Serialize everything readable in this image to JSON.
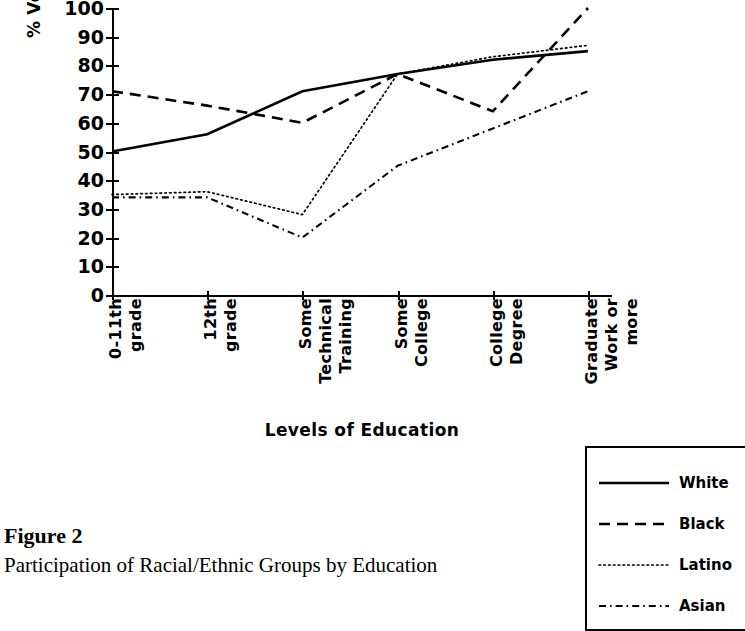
{
  "figure": {
    "number_label": "Figure 2",
    "caption": "Participation of Racial/Ethnic Groups by Education"
  },
  "chart_data": {
    "type": "line",
    "title": "",
    "xlabel": "Levels of Education",
    "ylabel": "% Voting of Eligible Voters",
    "categories": [
      "0-11th grade",
      "12th grade",
      "Some Technical Training",
      "Some College",
      "College Degree",
      "Graduate Work or more"
    ],
    "category_lines": [
      [
        "0-11th",
        "grade"
      ],
      [
        "12th",
        "grade"
      ],
      [
        "Some",
        "Technical",
        "Training"
      ],
      [
        "Some",
        "College"
      ],
      [
        "College",
        "Degree"
      ],
      [
        "Graduate",
        "Work or",
        "more"
      ]
    ],
    "ylim": [
      0,
      100
    ],
    "yticks": [
      0,
      10,
      20,
      30,
      40,
      50,
      60,
      70,
      80,
      90,
      100
    ],
    "ytick_labels": [
      "0",
      "10",
      "20",
      "30",
      "40",
      "50",
      "60",
      "70",
      "80",
      "90",
      "100"
    ],
    "grid": false,
    "legend_position": "right-outside",
    "series": [
      {
        "name": "White",
        "style": "solid",
        "values": [
          50,
          56,
          71,
          77,
          82,
          85
        ]
      },
      {
        "name": "Black",
        "style": "dashed",
        "values": [
          71,
          66,
          60,
          77,
          64,
          100
        ]
      },
      {
        "name": "Latino",
        "style": "dotted",
        "values": [
          35,
          36,
          28,
          77,
          83,
          87
        ]
      },
      {
        "name": "Asian",
        "style": "dash-dot",
        "values": [
          34,
          34,
          20,
          45,
          58,
          71
        ]
      }
    ]
  },
  "legend": {
    "entries": [
      {
        "label": "White",
        "style": "solid"
      },
      {
        "label": "Black",
        "style": "dashed"
      },
      {
        "label": "Latino",
        "style": "dotted"
      },
      {
        "label": "Asian",
        "style": "dash-dot"
      }
    ]
  },
  "colors": {
    "ink": "#000000",
    "background": "#ffffff"
  }
}
